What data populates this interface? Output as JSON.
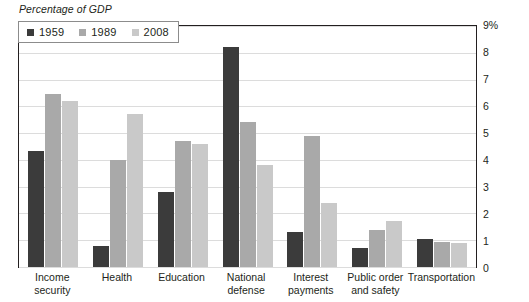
{
  "title": "Percentage of GDP",
  "legend": {
    "items": [
      {
        "label": "1959",
        "color": "#3b3b3b",
        "swatch_name": "legend-swatch-1959"
      },
      {
        "label": "1989",
        "color": "#a9a9a9",
        "swatch_name": "legend-swatch-1989"
      },
      {
        "label": "2008",
        "color": "#c9c9c9",
        "swatch_name": "legend-swatch-2008"
      }
    ]
  },
  "y_axis": {
    "ticks": [
      "9%",
      "8",
      "7",
      "6",
      "5",
      "4",
      "3",
      "2",
      "1",
      "0"
    ]
  },
  "x_axis": {
    "labels": [
      {
        "line1": "Income",
        "line2": "security"
      },
      {
        "line1": "Health",
        "line2": ""
      },
      {
        "line1": "Education",
        "line2": ""
      },
      {
        "line1": "National",
        "line2": "defense"
      },
      {
        "line1": "Interest",
        "line2": "payments"
      },
      {
        "line1": "Public order",
        "line2": "and safety"
      },
      {
        "line1": "Transportation",
        "line2": ""
      }
    ]
  },
  "chart_data": {
    "type": "bar",
    "title": "Percentage of GDP",
    "xlabel": "",
    "ylabel": "Percentage of GDP",
    "ylim": [
      0,
      9
    ],
    "ytick_step": 1,
    "grid": true,
    "legend_position": "top-left-inside",
    "categories": [
      "Income security",
      "Health",
      "Education",
      "National defense",
      "Interest payments",
      "Public order and safety",
      "Transportation"
    ],
    "series": [
      {
        "name": "1959",
        "color": "#3b3b3b",
        "values": [
          4.35,
          0.8,
          2.8,
          8.2,
          1.3,
          0.7,
          1.05
        ]
      },
      {
        "name": "1989",
        "color": "#a9a9a9",
        "values": [
          6.45,
          4.0,
          4.7,
          5.4,
          4.9,
          1.4,
          0.95
        ]
      },
      {
        "name": "2008",
        "color": "#c9c9c9",
        "values": [
          6.2,
          5.7,
          4.6,
          3.8,
          2.4,
          1.7,
          0.9
        ]
      }
    ]
  }
}
